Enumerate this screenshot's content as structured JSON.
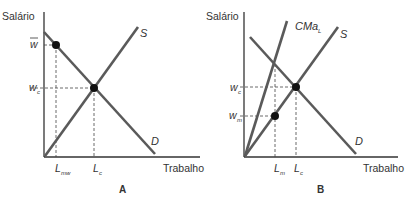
{
  "panel_a": {
    "label": "A",
    "y_axis_label": "Salário",
    "x_axis_label": "Trabalho",
    "curves": {
      "supply": "S",
      "demand": "D"
    },
    "y_ticks": {
      "w_bar": "w",
      "w_c": "w",
      "w_c_sub": "c"
    },
    "x_ticks": {
      "L_mw": "L",
      "L_mw_sub": "mw",
      "L_c": "L",
      "L_c_sub": "c"
    }
  },
  "panel_b": {
    "label": "B",
    "y_axis_label": "Salário",
    "x_axis_label": "Trabalho",
    "curves": {
      "marginal_cost": "CMa",
      "marginal_cost_sub": "L",
      "supply": "S",
      "demand": "D"
    },
    "y_ticks": {
      "w_c": "w",
      "w_c_sub": "c",
      "w_m": "w",
      "w_m_sub": "m"
    },
    "x_ticks": {
      "L_m": "L",
      "L_m_sub": "m",
      "L_c": "L",
      "L_c_sub": "c"
    }
  },
  "colors": {
    "curve": "#5a5a5a",
    "axis": "#333333",
    "dot": "#111111",
    "guide": "#444444"
  }
}
